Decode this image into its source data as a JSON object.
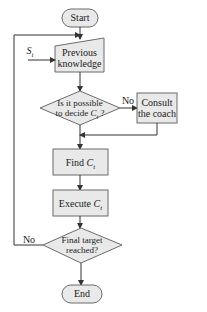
{
  "diagram": {
    "type": "flowchart",
    "colors": {
      "fill": "#e9e9e9",
      "stroke": "#6b6b6b",
      "line": "#333333",
      "text": "#1a1a1a"
    },
    "nodes": {
      "start": {
        "label": "Start",
        "shape": "terminal"
      },
      "previous_knowledge": {
        "line1": "Previous",
        "line2": "knowledge",
        "shape": "manual-input"
      },
      "input_si": {
        "base": "S",
        "sub": "i"
      },
      "decide": {
        "line1": "Is it possible",
        "line2_pre": "to decide ",
        "line2_var": "C",
        "line2_sub": "t",
        "line2_post": " ?",
        "shape": "decision"
      },
      "consult": {
        "line1": "Consult",
        "line2": "the coach",
        "shape": "process"
      },
      "find": {
        "pre": "Find ",
        "var": "C",
        "sub": "t",
        "shape": "process"
      },
      "execute": {
        "pre": "Execute ",
        "var": "C",
        "sub": "t",
        "shape": "process"
      },
      "final": {
        "line1": "Final target",
        "line2": "reached?",
        "shape": "decision"
      },
      "end": {
        "label": "End",
        "shape": "terminal"
      }
    },
    "edge_labels": {
      "decide_no": "No",
      "final_no": "No"
    },
    "edges": [
      {
        "from": "start",
        "to": "previous_knowledge"
      },
      {
        "from": "input_si",
        "to": "previous_knowledge"
      },
      {
        "from": "previous_knowledge",
        "to": "decide"
      },
      {
        "from": "decide",
        "to": "consult",
        "label": "No"
      },
      {
        "from": "consult",
        "to": "find"
      },
      {
        "from": "decide",
        "to": "find"
      },
      {
        "from": "find",
        "to": "execute"
      },
      {
        "from": "execute",
        "to": "final"
      },
      {
        "from": "final",
        "to": "previous_knowledge",
        "label": "No"
      },
      {
        "from": "final",
        "to": "end"
      }
    ]
  }
}
